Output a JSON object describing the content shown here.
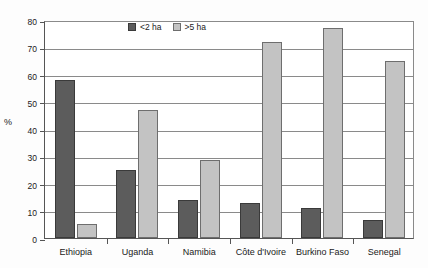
{
  "chart_data": {
    "type": "bar",
    "title": "",
    "xlabel": "",
    "ylabel": "%",
    "ylim": [
      0,
      80
    ],
    "ytick_step": 10,
    "yticks": [
      0,
      10,
      20,
      30,
      40,
      50,
      60,
      70,
      80
    ],
    "grid": true,
    "legend_position": "top-center",
    "categories": [
      "Ethiopia",
      "Uganda",
      "Namibia",
      "Côte d'Ivoire",
      "Burkino Faso",
      "Senegal"
    ],
    "series": [
      {
        "name": "<2 ha",
        "color": "#5c5c5c",
        "values": [
          58,
          25,
          14,
          13,
          11,
          6.5
        ]
      },
      {
        "name": ">5 ha",
        "color": "#c3c3c3",
        "values": [
          5,
          47,
          28.5,
          72,
          77,
          65
        ]
      }
    ]
  },
  "axis": {
    "y_title": "%"
  },
  "legend": {
    "items": [
      {
        "label": "<2 ha",
        "swatch": "dark"
      },
      {
        "label": ">5 ha",
        "swatch": "light"
      }
    ]
  }
}
